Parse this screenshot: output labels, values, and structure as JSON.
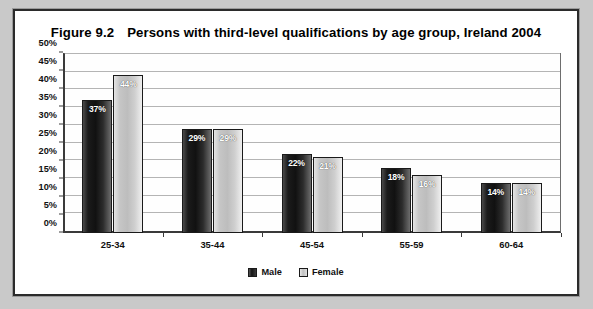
{
  "figure": {
    "number": "Figure 9.2",
    "title": "Persons with third-level qualifications by age group, Ireland 2004"
  },
  "legend": {
    "male_label": "Male",
    "female_label": "Female"
  },
  "chart_data": {
    "type": "bar",
    "xlabel": "",
    "ylabel": "",
    "ylim": [
      0,
      50
    ],
    "ytick_step": 5,
    "ytick_labels": [
      "0%",
      "5%",
      "10%",
      "15%",
      "20%",
      "25%",
      "30%",
      "35%",
      "40%",
      "45%",
      "50%"
    ],
    "ytick_values": [
      0,
      5,
      10,
      15,
      20,
      25,
      30,
      35,
      40,
      45,
      50
    ],
    "grid": true,
    "legend_position": "bottom-center",
    "value_suffix": "%",
    "categories": [
      "25-34",
      "35-44",
      "45-54",
      "55-59",
      "60-64"
    ],
    "series": [
      {
        "name": "Male",
        "color": "#1b1b1b",
        "values": [
          37,
          29,
          22,
          18,
          14
        ],
        "labels": [
          "37%",
          "29%",
          "22%",
          "18%",
          "14%"
        ]
      },
      {
        "name": "Female",
        "color": "#c6c6c6",
        "values": [
          44,
          29,
          21,
          16,
          14
        ],
        "labels": [
          "44%",
          "29%",
          "21%",
          "16%",
          "14%"
        ]
      }
    ]
  }
}
